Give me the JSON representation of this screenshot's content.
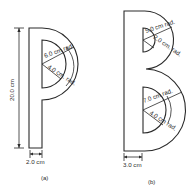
{
  "figure_a": {
    "caption": "(a)",
    "letter": "P",
    "labels": {
      "height": "20.0 cm",
      "outer_radius": "6.0 cm rad.",
      "inner_radius": "4.0 cm. rad.",
      "stem_width": "2.0 cm"
    }
  },
  "figure_b": {
    "caption": "(b)",
    "letter": "B",
    "labels": {
      "upper_outer_radius": "5.0 cm rad.",
      "upper_inner_radius": "2.0 cm. rad.",
      "lower_outer_radius": "7.0 cm rad.",
      "lower_inner_radius": "4.0 cm rad.",
      "stem_width": "3.0 cm"
    }
  },
  "colors": {
    "line": "#2a2a2a",
    "background": "#ffffff"
  }
}
